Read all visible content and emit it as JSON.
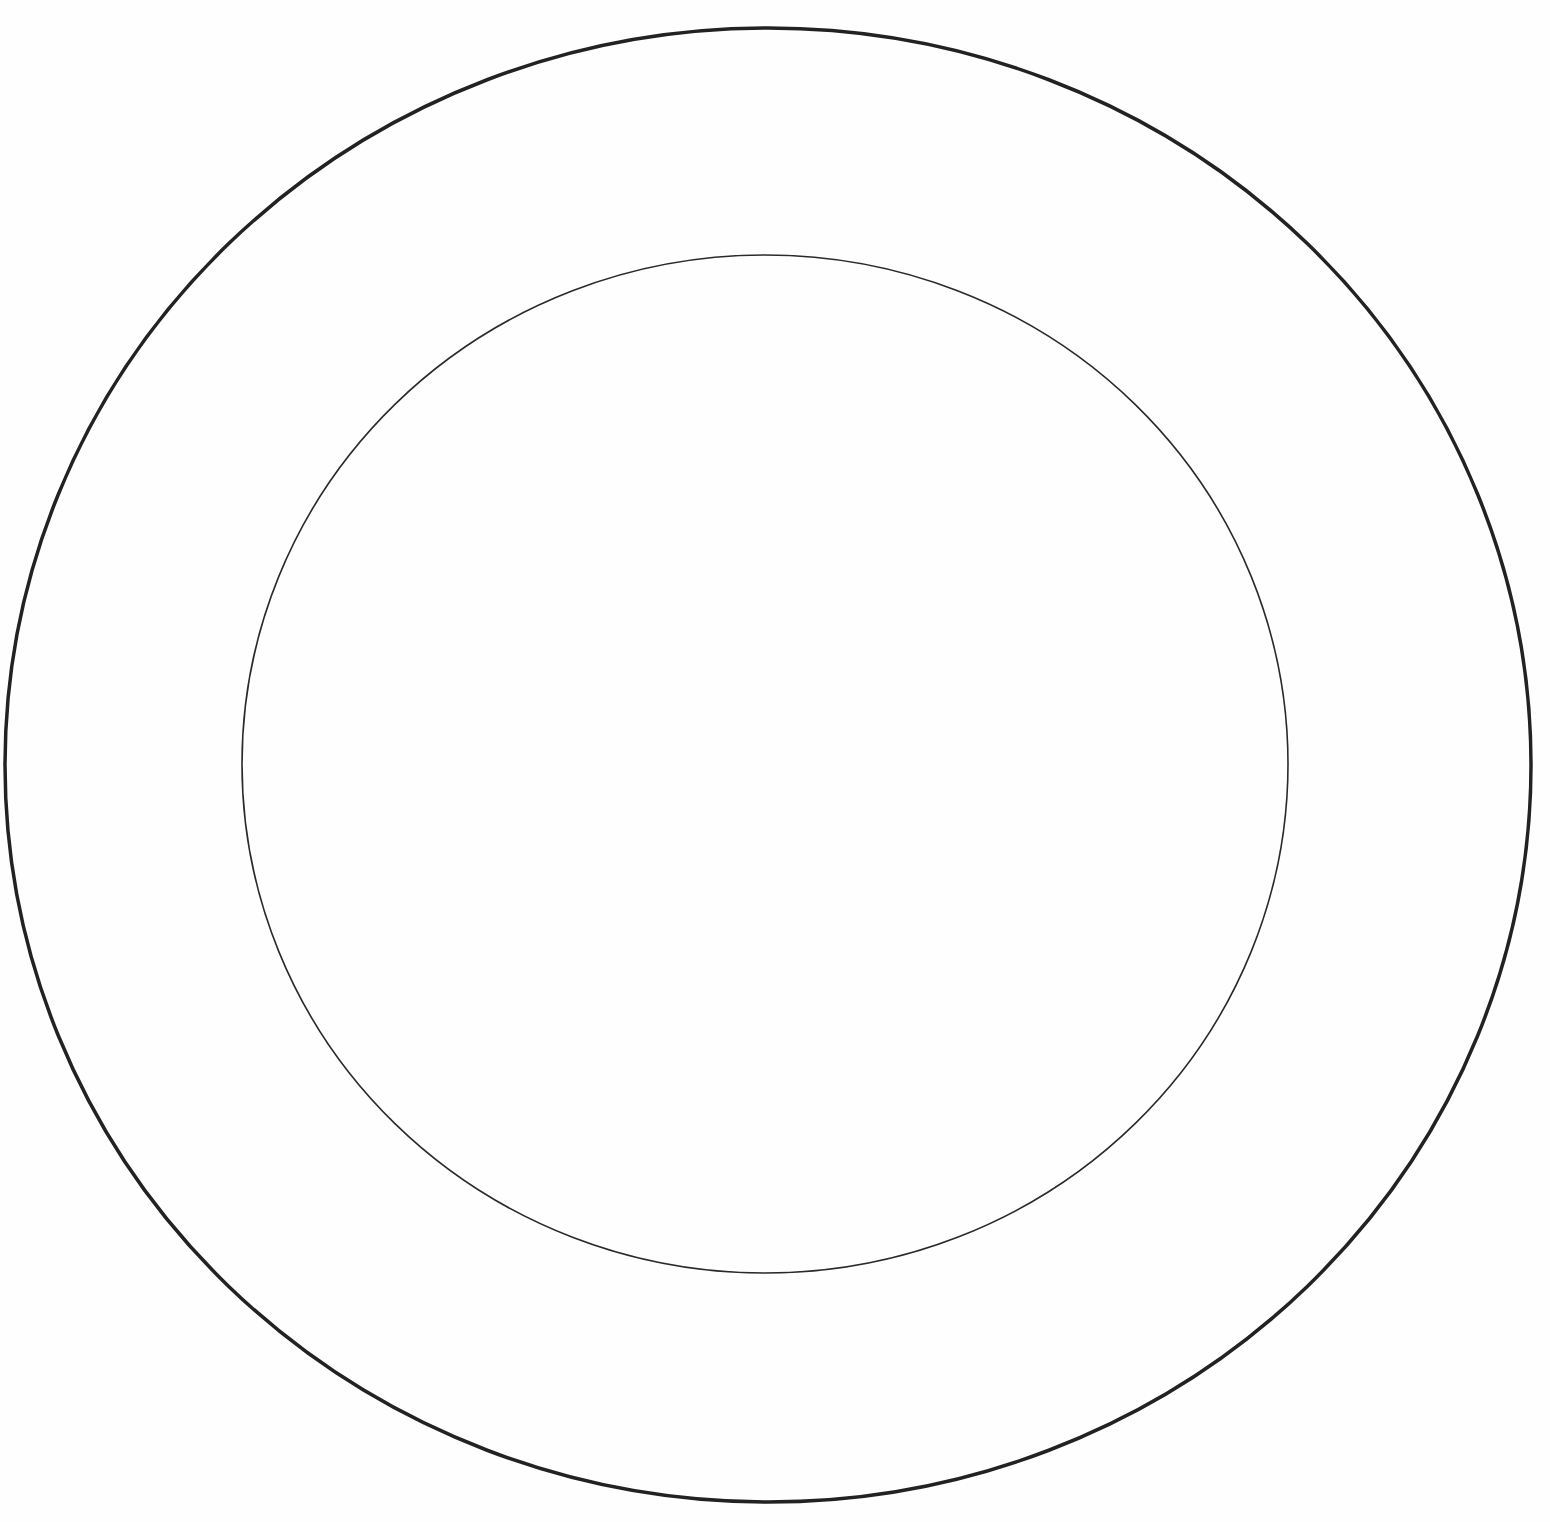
{
  "diagram": {
    "background": "#ffffff",
    "shapes": [
      {
        "id": "outer-ring",
        "type": "ellipse",
        "cx": 768,
        "cy": 765,
        "rx": 763,
        "ry": 737,
        "stroke": "#222222",
        "stroke_width": 3.5
      },
      {
        "id": "inner-ring",
        "type": "ellipse",
        "cx": 765,
        "cy": 764,
        "rx": 523,
        "ry": 509,
        "stroke": "#2a2a2a",
        "stroke_width": 1.6
      }
    ]
  }
}
